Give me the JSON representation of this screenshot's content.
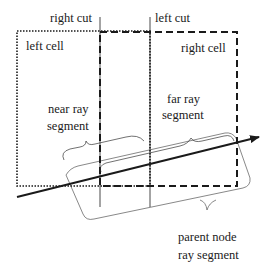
{
  "labels": {
    "right_cut": "right cut",
    "left_cut": "left cut",
    "left_cell": "left cell",
    "right_cell": "right cell",
    "near_ray_1": "near ray",
    "near_ray_2": "segment",
    "far_ray_1": "far ray",
    "far_ray_2": "segment",
    "parent_1": "parent node",
    "parent_2": "ray segment"
  },
  "colors": {
    "stroke": "#1a1a1a",
    "background": "#ffffff"
  }
}
